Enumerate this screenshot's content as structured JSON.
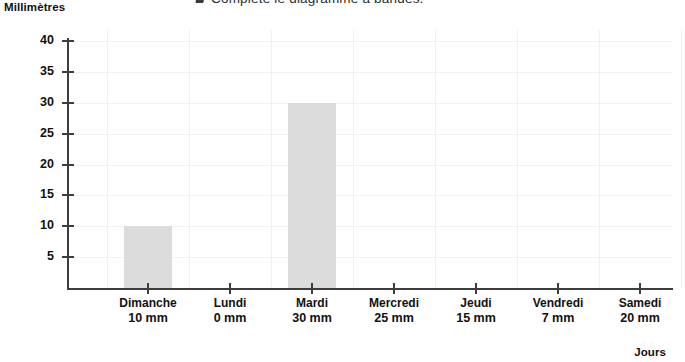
{
  "instruction": {
    "bullet": "square-bullet-icon",
    "text": "Complète le diagramme à bandes."
  },
  "chart_data": {
    "type": "bar",
    "title": "",
    "xlabel": "Jours",
    "ylabel": "Millimètres",
    "categories": [
      "Dimanche",
      "Lundi",
      "Mardi",
      "Mercredi",
      "Jeudi",
      "Vendredi",
      "Samedi"
    ],
    "values": [
      10,
      0,
      30,
      25,
      15,
      7,
      20
    ],
    "drawn_values": [
      10,
      0,
      30,
      null,
      null,
      null,
      null
    ],
    "value_labels": [
      "10 mm",
      "0 mm",
      "30 mm",
      "25 mm",
      "15 mm",
      "7 mm",
      "20 mm"
    ],
    "ylim": [
      0,
      40
    ],
    "ytick_labels": [
      "40",
      "35",
      "30",
      "25",
      "20",
      "15",
      "10",
      "5"
    ],
    "yticks": [
      40,
      35,
      30,
      25,
      20,
      15,
      10,
      5
    ],
    "grid": true,
    "legend": false,
    "bar_color": "#dcdcdc",
    "axis_color": "#3d3d3d",
    "grid_color": "#f1f1f1"
  }
}
